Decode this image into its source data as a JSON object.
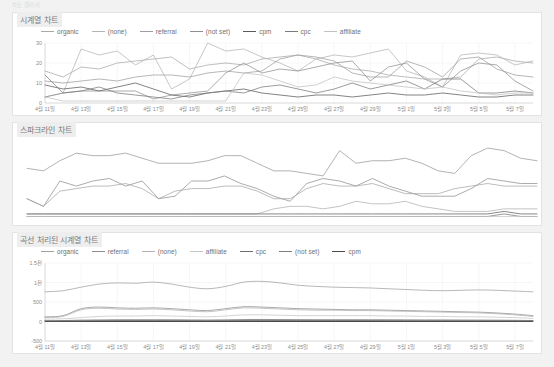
{
  "page": {
    "caption": "차트 갤러리",
    "background_color": "#f2f2f2",
    "card_color": "#ffffff"
  },
  "panels": [
    {
      "id": "timeseries",
      "title": "시계열 차트",
      "legend": [
        "organic",
        "(none)",
        "referral",
        "(not set)",
        "cpm",
        "cpc",
        "affiliate"
      ]
    },
    {
      "id": "sparkline",
      "title": "스파크라인 차트",
      "legend": []
    },
    {
      "id": "curved",
      "title": "곡선 처리된 시계열 차트",
      "legend": [
        "organic",
        "referral",
        "(none)",
        "affiliate",
        "cpc",
        "(not set)",
        "cpm"
      ]
    }
  ],
  "chart_data": [
    {
      "type": "line",
      "title": "시계열 차트",
      "xlabel": "",
      "ylabel": "",
      "ylim": [
        0,
        30
      ],
      "yticks": [
        0,
        10,
        20,
        30
      ],
      "grid": true,
      "legend_position": "top",
      "x": [
        "4월 11일",
        "4월 12일",
        "4월 13일",
        "4월 14일",
        "4월 15일",
        "4월 16일",
        "4월 17일",
        "4월 18일",
        "4월 19일",
        "4월 20일",
        "4월 21일",
        "4월 22일",
        "4월 23일",
        "4월 24일",
        "4월 25일",
        "4월 26일",
        "4월 27일",
        "4월 28일",
        "4월 29일",
        "4월 30일",
        "5월 1일",
        "5월 2일",
        "5월 3일",
        "5월 4일",
        "5월 5일",
        "5월 6일",
        "5월 7일",
        "5월 8일"
      ],
      "xtick_labels": [
        "4월 11일",
        "4월 13일",
        "4월 15일",
        "4월 17일",
        "4월 19일",
        "4월 21일",
        "4월 23일",
        "4월 25일",
        "4월 27일",
        "4월 29일",
        "5월 1일",
        "5월 3일",
        "5월 5일",
        "5월 7일"
      ],
      "series": [
        {
          "name": "organic",
          "color": "#a8a8a8",
          "values": [
            16,
            13,
            18,
            17,
            20,
            21,
            22,
            23,
            17,
            19,
            20,
            19,
            22,
            23,
            24,
            22,
            19,
            17,
            16,
            14,
            13,
            12,
            12,
            13,
            22,
            23,
            21,
            20
          ]
        },
        {
          "name": "(none)",
          "color": "#b4b4b4",
          "values": [
            3,
            5,
            27,
            24,
            26,
            19,
            24,
            7,
            12,
            30,
            26,
            27,
            23,
            20,
            16,
            22,
            24,
            23,
            25,
            27,
            16,
            13,
            8,
            24,
            25,
            24,
            19,
            21
          ]
        },
        {
          "name": "referral",
          "color": "#9e9e9e",
          "values": [
            11,
            10,
            11,
            12,
            11,
            13,
            14,
            14,
            13,
            15,
            16,
            15,
            16,
            22,
            24,
            23,
            21,
            15,
            13,
            13,
            21,
            18,
            13,
            22,
            23,
            17,
            14,
            13
          ]
        },
        {
          "name": "(not set)",
          "color": "#8f8f8f",
          "values": [
            3,
            5,
            6,
            6,
            6,
            6,
            2,
            4,
            5,
            6,
            15,
            20,
            15,
            17,
            16,
            18,
            20,
            21,
            11,
            18,
            20,
            12,
            8,
            16,
            20,
            19,
            11,
            6
          ]
        },
        {
          "name": "cpm",
          "color": "#5a5a5a",
          "values": [
            9,
            7,
            8,
            6,
            8,
            10,
            7,
            4,
            3,
            5,
            6,
            7,
            5,
            4,
            3,
            4,
            4,
            3,
            4,
            5,
            4,
            4,
            5,
            4,
            3,
            3,
            4,
            4
          ]
        },
        {
          "name": "cpc",
          "color": "#7a7a7a",
          "values": [
            14,
            5,
            6,
            8,
            5,
            4,
            3,
            2,
            4,
            5,
            6,
            5,
            8,
            9,
            7,
            5,
            7,
            10,
            7,
            9,
            11,
            7,
            12,
            12,
            5,
            5,
            6,
            5
          ]
        },
        {
          "name": "affiliate",
          "color": "#c2c2c2",
          "values": [
            3,
            1,
            1,
            1,
            1,
            1,
            1,
            1,
            1,
            1,
            1,
            15,
            14,
            11,
            8,
            9,
            13,
            11,
            10,
            9,
            8,
            7,
            8,
            6,
            5,
            4,
            5,
            5
          ]
        }
      ]
    },
    {
      "type": "line",
      "title": "스파크라인 차트",
      "xlabel": "",
      "ylabel": "",
      "ylim": [
        0,
        30
      ],
      "grid": false,
      "axes_visible": false,
      "legend_position": "none",
      "series": [
        {
          "name": "organic",
          "color": "#9a9a9a",
          "values": [
            20,
            19,
            23,
            26,
            25,
            25,
            26,
            24,
            22,
            22,
            22,
            23,
            25,
            25,
            22,
            19,
            19,
            18,
            17,
            27,
            22,
            23,
            23,
            24,
            22,
            19,
            18,
            25,
            28,
            27,
            24,
            23
          ]
        },
        {
          "name": "(none)",
          "color": "#8f8f8f",
          "values": [
            8,
            5,
            15,
            13,
            15,
            16,
            13,
            15,
            8,
            9,
            15,
            15,
            17,
            14,
            12,
            9,
            7,
            14,
            16,
            15,
            13,
            16,
            13,
            11,
            9,
            9,
            9,
            12,
            16,
            15,
            14,
            14
          ]
        },
        {
          "name": "referral",
          "color": "#a5a5a5",
          "values": [
            8,
            5,
            11,
            12,
            13,
            13,
            14,
            12,
            8,
            11,
            12,
            12,
            13,
            13,
            11,
            8,
            8,
            12,
            14,
            13,
            13,
            14,
            12,
            10,
            10,
            10,
            12,
            13,
            14,
            13,
            13,
            13
          ]
        },
        {
          "name": "(not set)",
          "color": "#b0b0b0",
          "values": [
            2,
            2,
            2,
            2,
            2,
            2,
            2,
            2,
            2,
            2,
            2,
            2,
            2,
            2,
            2,
            4,
            5,
            5,
            4,
            5,
            7,
            6,
            6,
            7,
            5,
            4,
            3,
            3,
            3,
            4,
            4,
            4
          ]
        },
        {
          "name": "cpm",
          "color": "#5f5f5f",
          "values": [
            2,
            2,
            2,
            2,
            2,
            2,
            2,
            2,
            2,
            2,
            2,
            2,
            2,
            2,
            2,
            2,
            2,
            2,
            2,
            2,
            2,
            2,
            2,
            2,
            2,
            2,
            2,
            2,
            2,
            3,
            2,
            2
          ]
        },
        {
          "name": "cpc",
          "color": "#787878",
          "values": [
            1,
            1,
            1,
            1,
            1,
            1,
            1,
            1,
            1,
            1,
            1,
            1,
            1,
            1,
            1,
            1,
            1,
            1,
            1,
            1,
            1,
            1,
            1,
            1,
            1,
            1,
            1,
            1,
            1,
            2,
            1,
            1
          ]
        },
        {
          "name": "affiliate",
          "color": "#c4c4c4",
          "values": [
            1,
            1,
            1,
            1,
            1,
            1,
            1,
            1,
            1,
            1,
            1,
            1,
            1,
            1,
            1,
            1,
            1,
            1,
            1,
            1,
            1,
            1,
            1,
            1,
            1,
            1,
            1,
            1,
            1,
            1,
            1,
            1
          ]
        }
      ]
    },
    {
      "type": "line",
      "title": "곡선 처리된 시계열 차트",
      "xlabel": "",
      "ylabel": "",
      "ylim": [
        -500,
        1500
      ],
      "yticks": [
        -500,
        0,
        500,
        1000,
        1500
      ],
      "ytick_labels": [
        "-500",
        "0",
        "500",
        "1천",
        "1.5천"
      ],
      "grid": true,
      "smooth": true,
      "legend_position": "top",
      "x": [
        "4월 11일",
        "4월 12일",
        "4월 13일",
        "4월 14일",
        "4월 15일",
        "4월 16일",
        "4월 17일",
        "4월 18일",
        "4월 19일",
        "4월 20일",
        "4월 21일",
        "4월 22일",
        "4월 23일",
        "4월 24일",
        "4월 25일",
        "4월 26일",
        "4월 27일",
        "4월 28일",
        "4월 29일",
        "4월 30일",
        "5월 1일",
        "5월 2일",
        "5월 3일",
        "5월 4일",
        "5월 5일",
        "5월 6일",
        "5월 7일",
        "5월 8일"
      ],
      "xtick_labels": [
        "4월 11일",
        "4월 13일",
        "4월 15일",
        "4월 17일",
        "4월 19일",
        "4월 21일",
        "4월 23일",
        "4월 25일",
        "4월 27일",
        "4월 29일",
        "5월 1일",
        "5월 3일",
        "5월 5일",
        "5월 7일"
      ],
      "series": [
        {
          "name": "organic",
          "color": "#a0a0a0",
          "values": [
            760,
            790,
            880,
            960,
            990,
            980,
            1010,
            960,
            880,
            840,
            900,
            1010,
            1030,
            990,
            930,
            900,
            880,
            870,
            860,
            840,
            820,
            800,
            790,
            800,
            810,
            800,
            780,
            760
          ]
        },
        {
          "name": "referral",
          "color": "#8d8d8d",
          "values": [
            120,
            150,
            330,
            370,
            350,
            340,
            350,
            330,
            300,
            280,
            330,
            380,
            370,
            350,
            330,
            320,
            310,
            300,
            300,
            290,
            280,
            270,
            260,
            250,
            240,
            220,
            190,
            150
          ]
        },
        {
          "name": "(none)",
          "color": "#b2b2b2",
          "values": [
            100,
            130,
            300,
            340,
            320,
            310,
            320,
            300,
            270,
            250,
            300,
            350,
            340,
            320,
            300,
            290,
            290,
            280,
            280,
            270,
            260,
            250,
            240,
            230,
            220,
            200,
            170,
            130
          ]
        },
        {
          "name": "affiliate",
          "color": "#c6c6c6",
          "values": [
            60,
            70,
            100,
            130,
            140,
            140,
            150,
            140,
            130,
            120,
            140,
            170,
            170,
            160,
            150,
            150,
            150,
            150,
            150,
            140,
            140,
            130,
            130,
            120,
            120,
            110,
            100,
            80
          ]
        },
        {
          "name": "cpc",
          "color": "#6f6f6f",
          "values": [
            20,
            25,
            35,
            40,
            45,
            45,
            45,
            45,
            40,
            38,
            42,
            50,
            52,
            50,
            48,
            46,
            46,
            46,
            45,
            44,
            42,
            40,
            40,
            38,
            36,
            34,
            30,
            25
          ]
        },
        {
          "name": "(not set)",
          "color": "#7d7d7d",
          "values": [
            10,
            12,
            18,
            22,
            24,
            24,
            24,
            24,
            22,
            20,
            22,
            26,
            28,
            26,
            25,
            24,
            24,
            24,
            24,
            23,
            22,
            21,
            21,
            20,
            19,
            18,
            16,
            13
          ]
        },
        {
          "name": "cpm",
          "color": "#4a4a4a",
          "values": [
            5,
            6,
            9,
            11,
            12,
            12,
            12,
            12,
            11,
            10,
            11,
            13,
            14,
            13,
            12,
            12,
            12,
            12,
            12,
            11,
            11,
            10,
            10,
            10,
            9,
            9,
            8,
            6
          ]
        }
      ]
    }
  ]
}
